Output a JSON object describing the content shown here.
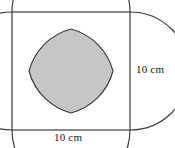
{
  "figure": {
    "labels": {
      "right_side": "10 cm",
      "bottom_side": "10 cm"
    },
    "colors": {
      "background": "#ffffff",
      "stroke": "#3c3c3c",
      "shaded_fill": "#c6c6c6",
      "unshaded_fill": "#ffffff",
      "label_text": "#1a1a1a"
    },
    "geometry": {
      "square": {
        "x": 12,
        "y": 12,
        "width": 118,
        "height": 118,
        "side_length_value": 10,
        "side_length_unit": "cm"
      },
      "arcs": {
        "count": 4,
        "kind": "semicircle-on-each-side-bulging-inward",
        "radius_px": 59,
        "centers_px": [
          {
            "name": "top-mid",
            "x": 71,
            "y": 12
          },
          {
            "name": "right-mid",
            "x": 130,
            "y": 71
          },
          {
            "name": "bottom-mid",
            "x": 71,
            "y": 130
          },
          {
            "name": "left-mid",
            "x": 12,
            "y": 71
          }
        ]
      },
      "arc_intersections_px": [
        {
          "name": "top-crossing",
          "x": 71,
          "y": 29
        },
        {
          "name": "right-crossing",
          "x": 113,
          "y": 71
        },
        {
          "name": "bottom-crossing",
          "x": 71,
          "y": 113
        },
        {
          "name": "left-crossing",
          "x": 29,
          "y": 71
        }
      ],
      "shaded_region": {
        "name": "central-petal",
        "vertices_px": [
          {
            "x": 71,
            "y": 29
          },
          {
            "x": 113,
            "y": 71
          },
          {
            "x": 71,
            "y": 113
          },
          {
            "x": 29,
            "y": 71
          }
        ]
      }
    }
  }
}
